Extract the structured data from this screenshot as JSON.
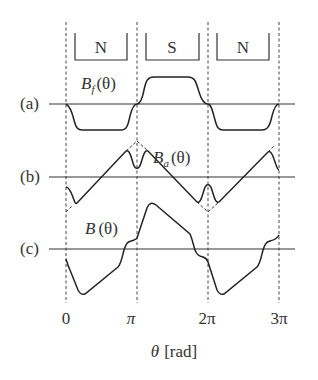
{
  "magnets": [
    {
      "label": "N"
    },
    {
      "label": "S"
    },
    {
      "label": "N"
    }
  ],
  "rows": [
    {
      "tag": "(a)",
      "curve_label_main": "B",
      "curve_label_sub": "f",
      "curve_label_arg": "(θ)"
    },
    {
      "tag": "(b)",
      "curve_label_main": "B",
      "curve_label_sub": "a",
      "curve_label_arg": "(θ)"
    },
    {
      "tag": "(c)",
      "curve_label_main": "B",
      "curve_label_sub": "",
      "curve_label_arg": "(θ)"
    }
  ],
  "x_ticks": [
    "0",
    "π",
    "2π",
    "3π"
  ],
  "x_axis_label": {
    "symbol": "θ",
    "unit": "[rad]"
  }
}
